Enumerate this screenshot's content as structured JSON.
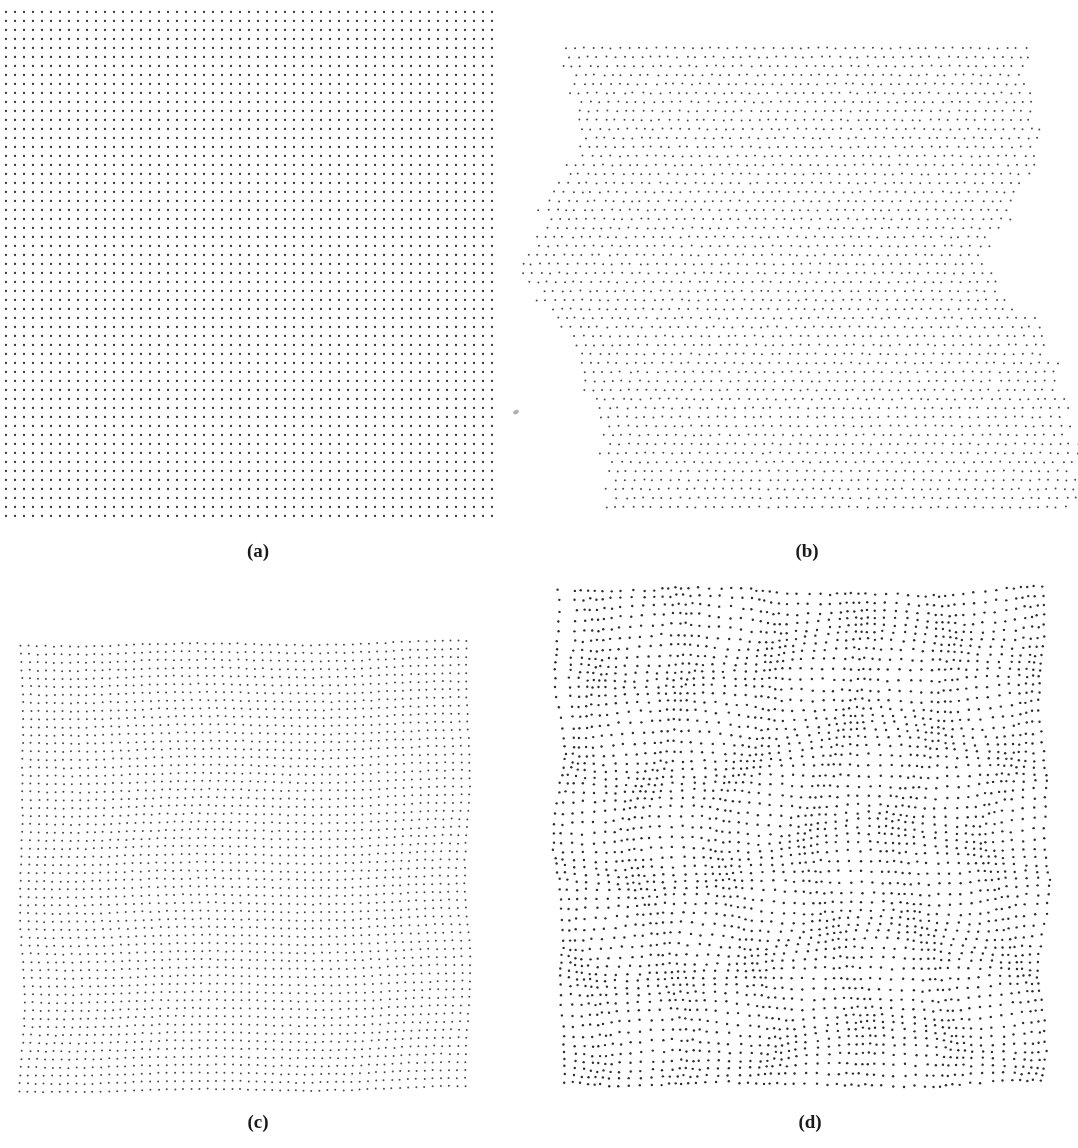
{
  "figure": {
    "panels": [
      {
        "id": "a",
        "caption": "(a)",
        "caption_pos": [
          258,
          552
        ],
        "type": "regular-grid",
        "origin": [
          6,
          12
        ],
        "cols": 55,
        "rows": 57,
        "spacing": 9,
        "dot_radius": 1.15,
        "dot_color": "#3a3a3a",
        "distortion": "none"
      },
      {
        "id": "b",
        "caption": "(b)",
        "caption_pos": [
          807,
          552
        ],
        "type": "sheared-rows",
        "origin": [
          566,
          48
        ],
        "cols": 52,
        "rows": 52,
        "spacing": 9,
        "dot_radius": 1.0,
        "dot_color": "#4a4a4a",
        "left_edge_profile": [
          [
            48,
            566
          ],
          [
            150,
            575
          ],
          [
            268,
            515
          ],
          [
            330,
            560
          ],
          [
            420,
            600
          ],
          [
            510,
            612
          ]
        ],
        "right_edge_profile": [
          [
            48,
            1025
          ],
          [
            150,
            1040
          ],
          [
            268,
            985
          ],
          [
            330,
            1040
          ],
          [
            420,
            1075
          ],
          [
            510,
            1075
          ]
        ],
        "distortion": "horizontal row jitter"
      },
      {
        "id": "c",
        "caption": "(c)",
        "caption_pos": [
          258,
          1123
        ],
        "type": "wavy-grid",
        "origin": [
          22,
          645
        ],
        "cols": 56,
        "rows": 56,
        "spacing": 8.1,
        "dot_radius": 1.0,
        "dot_color": "#4a4a4a",
        "distortion": "mild smooth warp"
      },
      {
        "id": "d",
        "caption": "(d)",
        "caption_pos": [
          810,
          1123
        ],
        "type": "clustered-grid",
        "origin": [
          560,
          592
        ],
        "cols": 56,
        "rows": 57,
        "spacing": 8.8,
        "dot_radius": 1.2,
        "dot_color": "#2e2e2e",
        "distortion": "strong clustered warp"
      }
    ],
    "artifacts": [
      {
        "kind": "smudge",
        "pos": [
          513,
          410
        ]
      }
    ]
  }
}
